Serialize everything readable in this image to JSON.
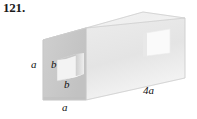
{
  "figure": {
    "problem_number": "121.",
    "caption": "",
    "object": "rectangular prism with square hole through its length",
    "labels": {
      "left_height": "a",
      "front_bottom_width": "a",
      "hole_height": "b",
      "hole_width": "b",
      "length": "4a"
    },
    "colors": {
      "front_face": "#c8c8c8",
      "top_face": "#f0f0f0",
      "side_face": "#e6e6e6",
      "hole_interior": "#f2f2f2",
      "hole_shadow": "#bdbdbd",
      "far_hole": "#f7f7f7",
      "outline": "#d9d9d9",
      "text": "#111111",
      "background": "#ffffff"
    }
  }
}
